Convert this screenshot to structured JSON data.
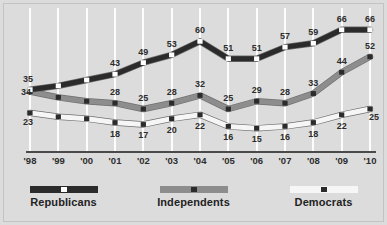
{
  "chart_data": {
    "type": "line",
    "title": "",
    "subtitle": "",
    "xlabel": "",
    "ylabel": "",
    "ylim": [
      10,
      70
    ],
    "grid": "vertical-only",
    "legend_position": "bottom",
    "categories": [
      "'98",
      "'99",
      "'00",
      "'01",
      "'02",
      "'03",
      "'04",
      "'05",
      "'06",
      "'07",
      "'08",
      "'09",
      "'10"
    ],
    "series": [
      {
        "name": "Republicans",
        "color": "#2b2b2b",
        "marker_color": "#ffffff",
        "values": [
          35,
          37,
          40,
          43,
          49,
          53,
          60,
          51,
          51,
          57,
          59,
          66,
          66
        ],
        "labels": [
          "35",
          "",
          "",
          "43",
          "49",
          "53",
          "60",
          "51",
          "51",
          "57",
          "59",
          "66",
          "66"
        ]
      },
      {
        "name": "Independents",
        "color": "#8d8d8d",
        "marker_color": "#2b2b2b",
        "values": [
          34,
          31,
          29,
          28,
          25,
          28,
          32,
          25,
          29,
          28,
          33,
          44,
          52
        ],
        "labels": [
          "34",
          "",
          "",
          "28",
          "25",
          "28",
          "32",
          "25",
          "29",
          "28",
          "33",
          "44",
          "52"
        ]
      },
      {
        "name": "Democrats",
        "color": "#f6f6f6",
        "marker_color": "#2b2b2b",
        "values": [
          23,
          21,
          20,
          18,
          17,
          20,
          22,
          16,
          15,
          16,
          18,
          22,
          25
        ],
        "labels": [
          "23",
          "",
          "",
          "18",
          "17",
          "20",
          "22",
          "16",
          "15",
          "16",
          "18",
          "22",
          "25"
        ]
      }
    ]
  },
  "legend": {
    "items": [
      {
        "label": "Republicans"
      },
      {
        "label": "Independents"
      },
      {
        "label": "Democrats"
      }
    ]
  },
  "colors": {
    "background": "#dcdcdc",
    "gridline": "#fdfdfd",
    "axis": "#4a4a4a",
    "text": "#2d2d2d",
    "republicans": "#2b2b2b",
    "independents": "#8d8d8d",
    "democrats": "#f6f6f6"
  }
}
